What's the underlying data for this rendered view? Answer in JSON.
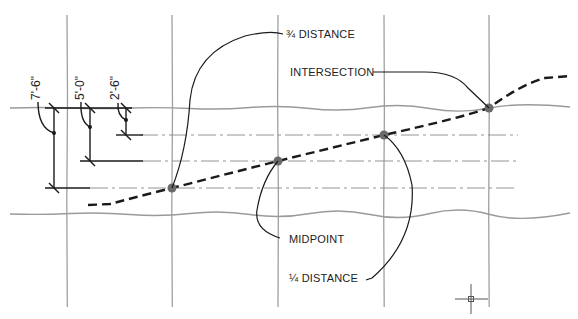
{
  "diagram": {
    "labels": {
      "three_quarter": "¾ DISTANCE",
      "intersection": "INTERSECTION",
      "midpoint": "MIDPOINT",
      "one_quarter": "¼ DISTANCE"
    },
    "dimensions": {
      "d1": "7'-6\"",
      "d2": "5'-0\"",
      "d3": "2'-6\""
    },
    "colors": {
      "grid": "#9a9a9a",
      "ink": "#1a1a1a",
      "point": "#666666"
    }
  }
}
